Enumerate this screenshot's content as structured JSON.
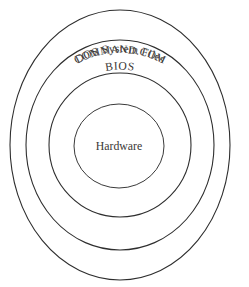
{
  "diagram": {
    "background_color": "#ffffff",
    "stroke_color": "#2e2e2e",
    "text_color": "#3b3836",
    "center": {
      "x": 120,
      "y": 145
    },
    "rings": [
      {
        "id": "ring-command-com",
        "label": "COMMAND.COM",
        "level": 1,
        "position": "outermost",
        "rx": 110,
        "ry": 135,
        "label_orientation": "curved"
      },
      {
        "id": "ring-dos-system-files",
        "label": "DOS System Files",
        "level": 2,
        "position": "second",
        "rx": 94,
        "ry": 105,
        "label_orientation": "curved"
      },
      {
        "id": "ring-bios",
        "label": "BIOS",
        "level": 3,
        "position": "third",
        "rx": 71,
        "ry": 72,
        "label_orientation": "curved"
      },
      {
        "id": "ring-hardware",
        "label": "Hardware",
        "level": 4,
        "position": "innermost",
        "rx": 45,
        "ry": 42,
        "label_orientation": "horizontal"
      }
    ]
  }
}
